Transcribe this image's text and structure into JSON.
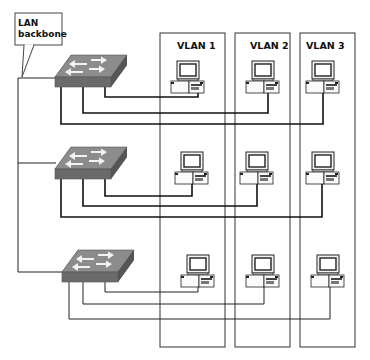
{
  "diagram": {
    "title": "",
    "callout": {
      "line1": "LAN",
      "line2": "backbone"
    },
    "vlans": [
      {
        "label": "VLAN 1",
        "x": 160,
        "width": 65
      },
      {
        "label": "VLAN 2",
        "x": 235,
        "width": 55
      },
      {
        "label": "VLAN 3",
        "x": 300,
        "width": 55
      }
    ],
    "switches": [
      {
        "name": "switch-1",
        "x": 55,
        "y": 55
      },
      {
        "name": "switch-2",
        "x": 55,
        "y": 148
      },
      {
        "name": "switch-3",
        "x": 62,
        "y": 250
      }
    ],
    "computers_per_switch": 3,
    "colors": {
      "line": "#111111",
      "switch_front": "#6e6e6e",
      "switch_top": "#8a8a8a",
      "background": "#ffffff"
    }
  }
}
